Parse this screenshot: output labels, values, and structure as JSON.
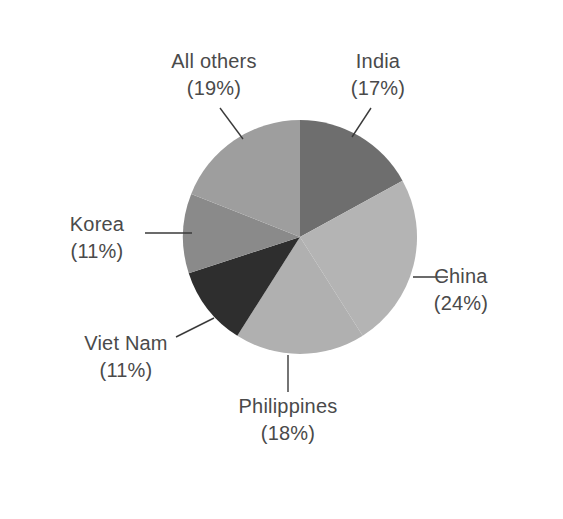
{
  "chart_data": {
    "type": "pie",
    "title": "",
    "subtitle": "",
    "xlabel": "",
    "ylabel": "",
    "legend_position": "none",
    "grid": false,
    "units": "percent",
    "start_angle_deg": 0,
    "direction": "clockwise",
    "categories": [
      "India",
      "China",
      "Philippines",
      "Viet Nam",
      "Korea",
      "All others"
    ],
    "values": [
      17,
      24,
      18,
      11,
      11,
      19
    ],
    "slices": [
      {
        "name": "india",
        "label": "India",
        "percent_text": "(17%)",
        "value": 17,
        "color": "#6e6e6e",
        "label_x": 378,
        "label_y": 68,
        "pct_x": 378,
        "pct_y": 95,
        "label_anchor": "middle",
        "leader": "M 371 108 L 352 137"
      },
      {
        "name": "china",
        "label": "China",
        "percent_text": "(24%)",
        "value": 24,
        "color": "#b4b4b4",
        "label_x": 461,
        "label_y": 283,
        "pct_x": 461,
        "pct_y": 310,
        "label_anchor": "middle",
        "leader": "M 413 277 L 448 277"
      },
      {
        "name": "philippines",
        "label": "Philippines",
        "percent_text": "(18%)",
        "value": 18,
        "color": "#b0b0b0",
        "label_x": 288,
        "label_y": 413,
        "pct_x": 288,
        "pct_y": 440,
        "label_anchor": "middle",
        "leader": "M 288 355 L 288 392"
      },
      {
        "name": "viet-nam",
        "label": "Viet Nam",
        "percent_text": "(11%)",
        "value": 11,
        "color": "#2e2e2e",
        "label_x": 126,
        "label_y": 350,
        "pct_x": 126,
        "pct_y": 377,
        "label_anchor": "middle",
        "leader": "M 176 337 L 214 318"
      },
      {
        "name": "korea",
        "label": "Korea",
        "percent_text": "(11%)",
        "value": 11,
        "color": "#8a8a8a",
        "label_x": 97,
        "label_y": 231,
        "pct_x": 97,
        "pct_y": 258,
        "label_anchor": "middle",
        "leader": "M 145 233 L 192 233"
      },
      {
        "name": "all-others",
        "label": "All others",
        "percent_text": "(19%)",
        "value": 19,
        "color": "#9e9e9e",
        "label_x": 214,
        "label_y": 68,
        "pct_x": 214,
        "pct_y": 95,
        "label_anchor": "middle",
        "leader": "M 220 108 L 243 139"
      }
    ],
    "geometry": {
      "center_x": 300,
      "center_y": 237,
      "radius": 117
    }
  },
  "canvas": {
    "background": "#ffffff",
    "text_color": "#4a4a4a",
    "leader_color": "#3a3a3a",
    "width": 563,
    "height": 519
  }
}
